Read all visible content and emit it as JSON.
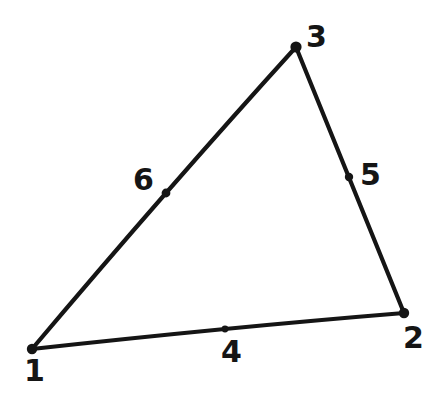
{
  "figure": {
    "type": "geometry-diagram",
    "title": "",
    "background_color": "#ffffff",
    "ink_color": "#151515",
    "canvas": {
      "width": 440,
      "height": 397
    },
    "stroke_width": 4.2,
    "nodes": [
      {
        "id": "1",
        "label": "1",
        "role": "vertex",
        "x": 32,
        "y": 349,
        "dot_radius": 5.2,
        "label_x": 24,
        "label_y": 356
      },
      {
        "id": "2",
        "label": "2",
        "role": "vertex",
        "x": 404,
        "y": 313,
        "dot_radius": 5.2,
        "label_x": 403,
        "label_y": 323
      },
      {
        "id": "3",
        "label": "3",
        "role": "vertex",
        "x": 296,
        "y": 47,
        "dot_radius": 5.6,
        "label_x": 306,
        "label_y": 22
      },
      {
        "id": "4",
        "label": "4",
        "role": "midpoint",
        "x": 225,
        "y": 329,
        "dot_radius": 3.4,
        "label_x": 221,
        "label_y": 337
      },
      {
        "id": "5",
        "label": "5",
        "role": "midpoint",
        "x": 349,
        "y": 177,
        "dot_radius": 4.2,
        "label_x": 360,
        "label_y": 160
      },
      {
        "id": "6",
        "label": "6",
        "role": "midpoint",
        "x": 166,
        "y": 193,
        "dot_radius": 4.4,
        "label_x": 133,
        "label_y": 165
      }
    ],
    "edges": [
      {
        "id": "edge-1-2",
        "from": "1",
        "to": "2",
        "via": "4"
      },
      {
        "id": "edge-1-3",
        "from": "1",
        "to": "3",
        "via": "6"
      },
      {
        "id": "edge-3-2",
        "from": "3",
        "to": "2",
        "via": "5"
      }
    ]
  }
}
